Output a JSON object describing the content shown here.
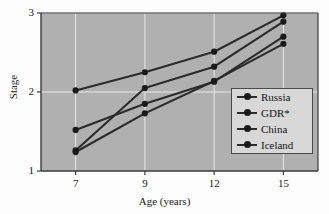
{
  "chart_data": {
    "type": "line",
    "title": "",
    "xlabel": "Age (years)",
    "ylabel": "Stage",
    "categories": [
      "7",
      "9",
      "12",
      "15"
    ],
    "x": [
      7,
      9,
      12,
      15
    ],
    "xtick_labels": [
      "7",
      "9",
      "12",
      "15"
    ],
    "ytick_labels": [
      "1",
      "2",
      "3"
    ],
    "yticks": [
      1,
      2,
      3
    ],
    "ylim": [
      1,
      3
    ],
    "grid": true,
    "legend_position": "lower-right-inside",
    "plot_background": "#b0b0b0",
    "grid_color": "#e8e8e8",
    "axis_color": "#3a3a3a",
    "line_color": "#2b2b2b",
    "marker_color": "#1a1a1a",
    "series": [
      {
        "name": "Russia",
        "values": [
          2.02,
          2.25,
          2.51,
          2.97
        ]
      },
      {
        "name": "GDR*",
        "values": [
          1.26,
          2.05,
          2.32,
          2.89
        ]
      },
      {
        "name": "China",
        "values": [
          1.52,
          1.85,
          2.13,
          2.7
        ]
      },
      {
        "name": "Iceland",
        "values": [
          1.24,
          1.73,
          2.14,
          2.61
        ]
      }
    ]
  },
  "legend": {
    "items": [
      {
        "label": "Russia"
      },
      {
        "label": "GDR*"
      },
      {
        "label": "China"
      },
      {
        "label": "Iceland"
      }
    ]
  }
}
